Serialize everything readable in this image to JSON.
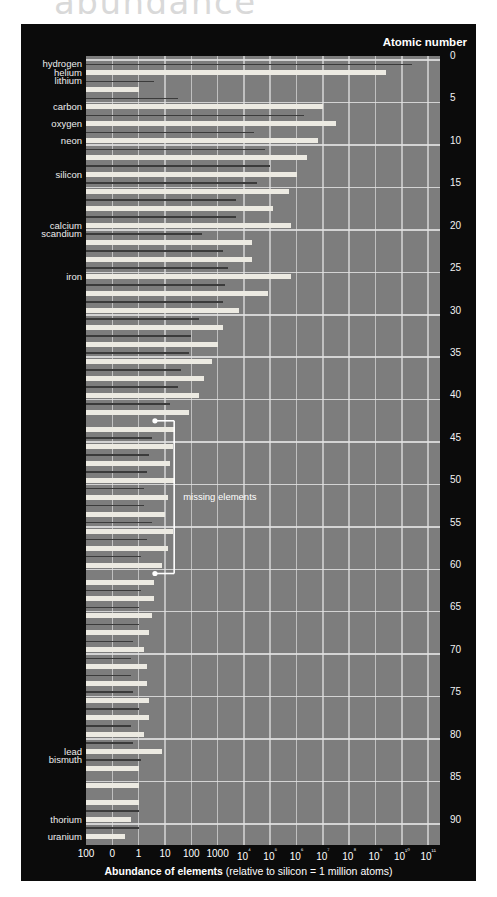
{
  "page": {
    "title": "abundance"
  },
  "figure": {
    "atomic_number_header": "Atomic number",
    "xaxis_title_bold": "Abundance of elements",
    "xaxis_title_rest": " (relative to silicon = 1 million atoms)",
    "annotation": {
      "label": "missing elements"
    },
    "colors": {
      "panel_background": "#0b0b0b",
      "plot_background": "#7d7d7d",
      "gridline": "#cfcfcf",
      "bar_even": "#eceae2",
      "bar_odd": "#3b3b3b",
      "text": "#ffffff"
    }
  },
  "chart_data": {
    "type": "bar",
    "orientation": "horizontal",
    "title": "abundance",
    "xlabel": "Abundance of elements (relative to silicon = 1 million atoms)",
    "ylabel": "Atomic number",
    "xscale": "log",
    "xlim": [
      0.01,
      100000000000
    ],
    "grid": true,
    "legend": null,
    "xtick_labels": [
      "100",
      "0",
      "1",
      "10",
      "100",
      "1000",
      "10⁴",
      "10⁵",
      "10⁶",
      "10⁷",
      "10⁸",
      "10⁹",
      "10¹⁰",
      "10¹¹"
    ],
    "xtick_exponents": [
      -2,
      -1,
      0,
      1,
      2,
      3,
      4,
      5,
      6,
      7,
      8,
      9,
      10,
      11
    ],
    "ytick_labels": [
      "0",
      "5",
      "10",
      "15",
      "20",
      "25",
      "30",
      "35",
      "40",
      "45",
      "50",
      "55",
      "60",
      "65",
      "70",
      "75",
      "80",
      "85",
      "90"
    ],
    "ytick_values": [
      0,
      5,
      10,
      15,
      20,
      25,
      30,
      35,
      40,
      45,
      50,
      55,
      60,
      65,
      70,
      75,
      80,
      85,
      90
    ],
    "labeled_elements": [
      {
        "name": "hydrogen",
        "z": 1
      },
      {
        "name": "helium",
        "z": 2
      },
      {
        "name": "lithium",
        "z": 3
      },
      {
        "name": "carbon",
        "z": 6
      },
      {
        "name": "oxygen",
        "z": 8
      },
      {
        "name": "neon",
        "z": 10
      },
      {
        "name": "silicon",
        "z": 14
      },
      {
        "name": "calcium",
        "z": 20
      },
      {
        "name": "scandium",
        "z": 21
      },
      {
        "name": "iron",
        "z": 26
      },
      {
        "name": "lead",
        "z": 82
      },
      {
        "name": "bismuth",
        "z": 83
      },
      {
        "name": "thorium",
        "z": 90
      },
      {
        "name": "uranium",
        "z": 92
      }
    ],
    "annotations": [
      {
        "text": "missing elements",
        "z_start": 43,
        "z_end": 61
      }
    ],
    "categories": [
      1,
      2,
      3,
      4,
      5,
      6,
      7,
      8,
      9,
      10,
      11,
      12,
      13,
      14,
      15,
      16,
      17,
      18,
      19,
      20,
      21,
      22,
      23,
      24,
      25,
      26,
      27,
      28,
      29,
      30,
      31,
      32,
      33,
      34,
      35,
      36,
      37,
      38,
      39,
      40,
      41,
      42,
      43,
      44,
      45,
      46,
      47,
      48,
      49,
      50,
      51,
      52,
      53,
      54,
      55,
      56,
      57,
      58,
      59,
      60,
      61,
      62,
      63,
      64,
      65,
      66,
      67,
      68,
      69,
      70,
      71,
      72,
      73,
      74,
      75,
      76,
      77,
      78,
      79,
      80,
      81,
      82,
      83,
      84,
      85,
      86,
      87,
      88,
      89,
      90,
      91,
      92
    ],
    "values": [
      10.4,
      9.4,
      0.6,
      0.0,
      1.5,
      7.0,
      6.3,
      7.5,
      4.4,
      6.8,
      4.8,
      6.4,
      5.0,
      6.0,
      4.5,
      5.7,
      3.7,
      5.1,
      3.7,
      5.8,
      2.4,
      4.3,
      3.2,
      4.3,
      3.4,
      5.8,
      3.3,
      4.9,
      3.2,
      3.8,
      2.3,
      3.2,
      2.0,
      3.0,
      1.9,
      2.8,
      1.6,
      2.5,
      1.5,
      2.3,
      1.2,
      1.9,
      0.0,
      1.4,
      0.5,
      1.3,
      0.4,
      1.2,
      0.3,
      1.4,
      0.2,
      1.1,
      0.2,
      1.0,
      0.5,
      1.3,
      0.3,
      1.1,
      0.1,
      0.9,
      0.0,
      0.6,
      0.1,
      0.6,
      0.0,
      0.5,
      0.0,
      0.4,
      -0.2,
      0.2,
      -0.3,
      0.3,
      -0.3,
      0.3,
      -0.2,
      0.4,
      0.0,
      0.4,
      -0.3,
      0.2,
      -0.2,
      0.9,
      0.1,
      0.0,
      0.0,
      0.0,
      0.0,
      0.0,
      0.0,
      -0.3,
      0.0,
      -0.5
    ],
    "value_units": "log10(atoms per 10^6 Si atoms)",
    "missing_z": [
      43,
      61,
      85,
      87
    ],
    "note": "alternating light (even Z) and dark (odd Z) bars show the Oddo-Harkins effect"
  }
}
